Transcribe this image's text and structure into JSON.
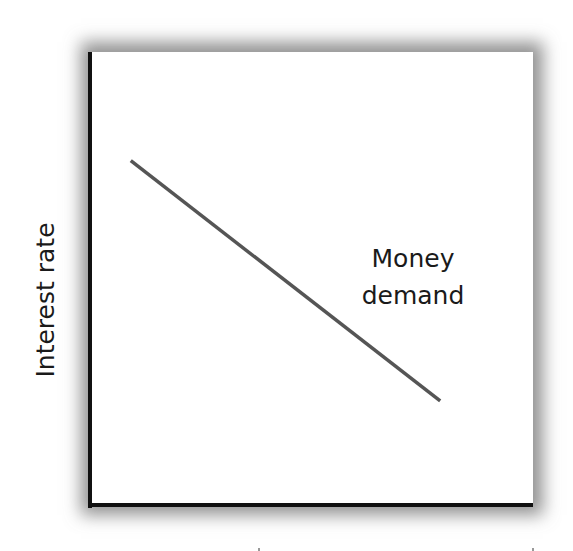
{
  "chart_data": {
    "type": "line",
    "title": "",
    "xlabel": "",
    "ylabel": "Interest rate",
    "xlim": [
      0,
      10
    ],
    "ylim": [
      0,
      10
    ],
    "grid": false,
    "legend": null,
    "ticks": {
      "x": [],
      "y": []
    },
    "series": [
      {
        "name": "Money demand",
        "x": [
          0.9,
          7.9
        ],
        "y": [
          7.6,
          2.3
        ],
        "color": "#555555"
      }
    ],
    "annotations": [
      {
        "text_lines": [
          "Money",
          "demand"
        ],
        "x": 7.3,
        "y": 5.5
      }
    ]
  },
  "labels": {
    "ylabel": "Interest rate",
    "curve_line1": "Money",
    "curve_line2": "demand"
  },
  "colors": {
    "axis": "#111111",
    "curve": "#555555",
    "shadow": "#8a8a8a",
    "background": "#ffffff"
  }
}
